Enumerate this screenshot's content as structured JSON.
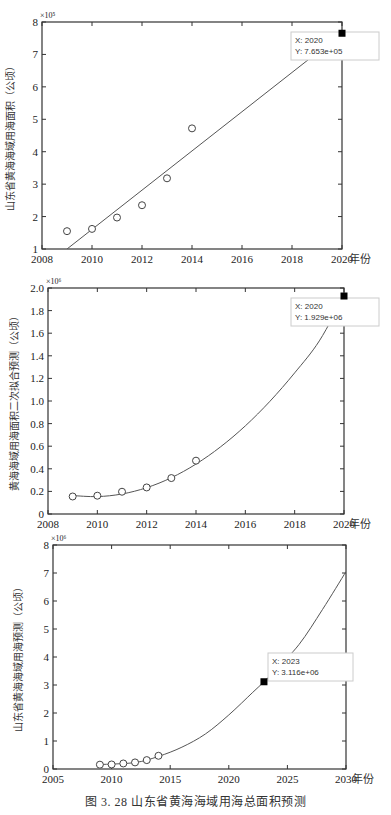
{
  "figure": {
    "caption": "图 3. 28    山东省黄海海域用海总面积预测"
  },
  "chart_data": [
    {
      "type": "scatter",
      "title": "",
      "xlabel": "年份",
      "ylabel": "山东省黄海海域用海面积（公顷）",
      "y_multiplier": "×10⁵",
      "xlim": [
        2008,
        2020
      ],
      "ylim": [
        1,
        8
      ],
      "x_ticks": [
        "2008",
        "2010",
        "2012",
        "2014",
        "2016",
        "2018",
        "2020"
      ],
      "y_ticks": [
        "1",
        "2",
        "3",
        "4",
        "5",
        "6",
        "7",
        "8"
      ],
      "grid": false,
      "series": [
        {
          "name": "observed",
          "marker": "circle",
          "x": [
            2009,
            2010,
            2011,
            2012,
            2013,
            2014
          ],
          "values": [
            1.55,
            1.62,
            1.97,
            2.35,
            3.18,
            4.72
          ]
        },
        {
          "name": "linear fit",
          "line": true,
          "x": [
            2009,
            2020
          ],
          "values": [
            1.0,
            7.653
          ]
        }
      ],
      "datatip": {
        "x_label": "X: 2020",
        "y_label": "Y: 7.653e+05",
        "x": 2020,
        "y": 7.653
      }
    },
    {
      "type": "scatter",
      "title": "",
      "xlabel": "年份",
      "ylabel": "黄海海域用海面积二次拟合预测（公顷）",
      "y_multiplier": "×10⁶",
      "xlim": [
        2008,
        2020
      ],
      "ylim": [
        0,
        2.0
      ],
      "x_ticks": [
        "2008",
        "2010",
        "2012",
        "2014",
        "2016",
        "2018",
        "2020"
      ],
      "y_ticks": [
        "0",
        "0.2",
        "0.4",
        "0.6",
        "0.8",
        "1.0",
        "1.2",
        "1.4",
        "1.6",
        "1.8",
        "2.0"
      ],
      "grid": false,
      "series": [
        {
          "name": "observed",
          "marker": "circle",
          "x": [
            2009,
            2010,
            2011,
            2012,
            2013,
            2014
          ],
          "values": [
            0.155,
            0.162,
            0.197,
            0.235,
            0.318,
            0.472
          ]
        },
        {
          "name": "quadratic fit",
          "line": true,
          "x": [
            2009,
            2010,
            2011,
            2012,
            2013,
            2014,
            2015,
            2016,
            2017,
            2018,
            2019,
            2020
          ],
          "values": [
            0.163,
            0.154,
            0.177,
            0.233,
            0.321,
            0.442,
            0.595,
            0.78,
            0.998,
            1.249,
            1.532,
            1.929
          ]
        }
      ],
      "datatip": {
        "x_label": "X: 2020",
        "y_label": "Y: 1.929e+06",
        "x": 2020,
        "y": 1.929
      }
    },
    {
      "type": "scatter",
      "title": "",
      "xlabel": "年份",
      "ylabel": "山东省黄海海域用海预测（公顷）",
      "y_multiplier": "×10⁶",
      "xlim": [
        2005,
        2030
      ],
      "ylim": [
        0,
        8
      ],
      "x_ticks": [
        "2005",
        "2010",
        "2015",
        "2020",
        "2025",
        "2030"
      ],
      "y_ticks": [
        "0",
        "1",
        "2",
        "3",
        "4",
        "5",
        "6",
        "7",
        "8"
      ],
      "grid": false,
      "series": [
        {
          "name": "observed",
          "marker": "circle",
          "x": [
            2009,
            2010,
            2011,
            2012,
            2013,
            2014
          ],
          "values": [
            0.155,
            0.162,
            0.197,
            0.235,
            0.318,
            0.472
          ]
        },
        {
          "name": "fit",
          "line": true,
          "x": [
            2009,
            2012,
            2014,
            2016,
            2018,
            2020,
            2022,
            2023,
            2024,
            2026,
            2028,
            2030
          ],
          "values": [
            0.16,
            0.23,
            0.45,
            0.78,
            1.25,
            1.93,
            2.72,
            3.116,
            3.55,
            4.45,
            5.7,
            7.05
          ]
        }
      ],
      "datatip": {
        "x_label": "X: 2023",
        "y_label": "Y: 3.116e+06",
        "x": 2023,
        "y": 3.116
      }
    }
  ]
}
